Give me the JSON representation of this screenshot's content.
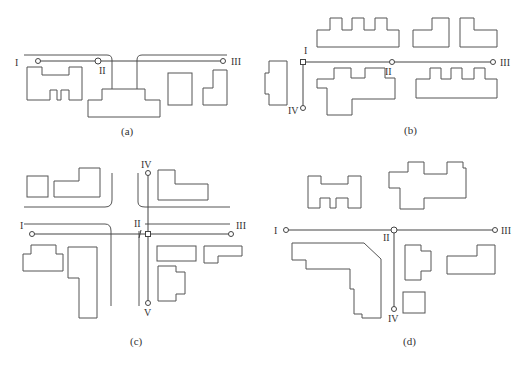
{
  "figure": {
    "panels": [
      {
        "id": "a",
        "caption": "(a)",
        "nodes": [
          {
            "label": "I"
          },
          {
            "label": "II"
          },
          {
            "label": "III"
          }
        ]
      },
      {
        "id": "b",
        "caption": "(b)",
        "nodes": [
          {
            "label": "I"
          },
          {
            "label": "II"
          },
          {
            "label": "III"
          },
          {
            "label": "IV"
          }
        ]
      },
      {
        "id": "c",
        "caption": "(c)",
        "nodes": [
          {
            "label": "I"
          },
          {
            "label": "II"
          },
          {
            "label": "III"
          },
          {
            "label": "IV"
          },
          {
            "label": "V"
          }
        ]
      },
      {
        "id": "d",
        "caption": "(d)",
        "nodes": [
          {
            "label": "I"
          },
          {
            "label": "II"
          },
          {
            "label": "III"
          },
          {
            "label": "IV"
          }
        ]
      }
    ]
  },
  "colors": {
    "line": "#555555",
    "background": "#ffffff"
  }
}
